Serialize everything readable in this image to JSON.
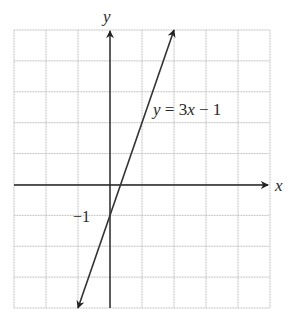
{
  "chart_data": {
    "type": "line",
    "title": "",
    "equation_label": "y = 3x − 1",
    "xlabel": "x",
    "ylabel": "y",
    "xlim": [
      -3,
      5
    ],
    "ylim": [
      -4,
      5
    ],
    "grid": true,
    "grid_step": 1,
    "series": [
      {
        "name": "y = 3x - 1",
        "slope": 3,
        "intercept": -1,
        "x": [
          -1,
          0,
          0.3333,
          2
        ],
        "y": [
          -4,
          -1,
          0,
          5
        ],
        "arrows_both_ends": true
      }
    ],
    "annotations": [
      {
        "text": "−1",
        "x": 0,
        "y": -1,
        "note": "y-intercept label"
      }
    ]
  },
  "labels": {
    "x_axis": "x",
    "y_axis": "y",
    "equation": "y = 3x − 1",
    "intercept": "−1"
  },
  "colors": {
    "grid": "#b8b8b8",
    "axis": "#222222",
    "line": "#333333"
  }
}
